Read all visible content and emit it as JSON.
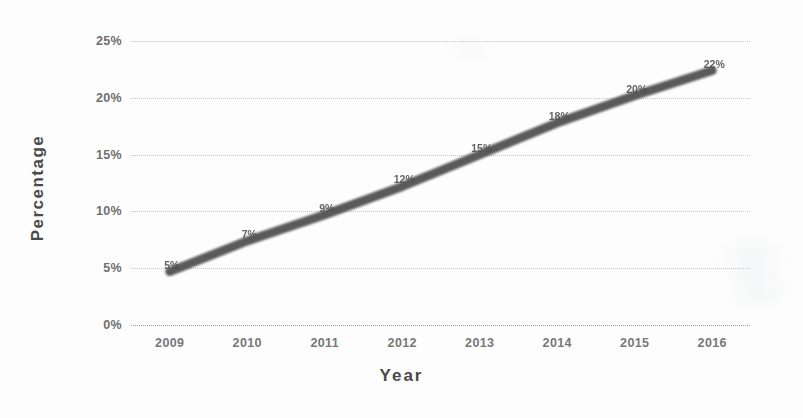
{
  "chart_data": {
    "type": "line",
    "title": "",
    "xlabel": "Year",
    "ylabel": "Percentage",
    "categories": [
      "2009",
      "2010",
      "2011",
      "2012",
      "2013",
      "2014",
      "2015",
      "2016"
    ],
    "x": [
      2009,
      2010,
      2011,
      2012,
      2013,
      2014,
      2015,
      2016
    ],
    "values": [
      4.7,
      7.4,
      9.7,
      12.2,
      15.0,
      17.8,
      20.2,
      22.4
    ],
    "point_labels": [
      "5%",
      "7%",
      "9%",
      "12%",
      "15%",
      "18%",
      "20%",
      "22%"
    ],
    "series": [
      {
        "name": "Percentage",
        "values": [
          4.7,
          7.4,
          9.7,
          12.2,
          15.0,
          17.8,
          20.2,
          22.4
        ],
        "color": "#4d4d4d"
      }
    ],
    "ylim": [
      0,
      25
    ],
    "ytick_values": [
      0,
      5,
      10,
      15,
      20,
      25
    ],
    "ytick_labels": [
      "0%",
      "5%",
      "10%",
      "15%",
      "20%",
      "25%"
    ],
    "grid": true,
    "grid_axis": "y",
    "grid_style": "dotted",
    "legend": "none",
    "line_width_px": 9,
    "background_color": "#ffffff",
    "grid_color": "#969696",
    "tick_label_color": "#6f6f6f",
    "axis_title_color": "#4a4a4a"
  },
  "axis": {
    "y_title": "Percentage",
    "x_title": "Year"
  }
}
